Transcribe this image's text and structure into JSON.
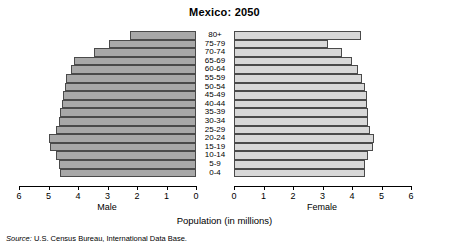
{
  "chart_data": {
    "type": "bar",
    "chart_subtype": "population-pyramid",
    "title": "Mexico: 2050",
    "xlabel": "Population (in millions)",
    "ylabel": "",
    "unit": "millions",
    "categories": [
      "80+",
      "75-79",
      "70-74",
      "65-69",
      "60-64",
      "55-59",
      "50-54",
      "45-49",
      "40-44",
      "35-39",
      "30-34",
      "25-29",
      "20-24",
      "15-19",
      "10-14",
      "5-9",
      "0-4"
    ],
    "series": [
      {
        "name": "Male",
        "side": "left",
        "axis_range": [
          0,
          6
        ],
        "axis_direction": "reverse",
        "values": [
          2.25,
          2.95,
          3.45,
          4.15,
          4.25,
          4.4,
          4.45,
          4.5,
          4.55,
          4.6,
          4.65,
          4.75,
          5.0,
          4.95,
          4.75,
          4.65,
          4.6
        ]
      },
      {
        "name": "Female",
        "side": "right",
        "axis_range": [
          0,
          6
        ],
        "axis_direction": "normal",
        "values": [
          4.3,
          3.2,
          3.65,
          4.0,
          4.2,
          4.35,
          4.45,
          4.5,
          4.5,
          4.55,
          4.55,
          4.6,
          4.75,
          4.7,
          4.55,
          4.45,
          4.45
        ]
      }
    ],
    "xticks_male": [
      "6",
      "5",
      "4",
      "3",
      "2",
      "1",
      "0"
    ],
    "xticks_female": [
      "0",
      "1",
      "2",
      "3",
      "4",
      "5",
      "6"
    ],
    "grid": false,
    "legend": "none",
    "colors": {
      "male_bar": "#a8a8a8",
      "female_bar": "#d8d8d8",
      "bar_outline": "#4a4a4a",
      "axis": "#000000",
      "background": "#ffffff"
    }
  },
  "labels": {
    "male_axis_title": "Male",
    "female_axis_title": "Female"
  },
  "source": {
    "prefix": "Source:",
    "text": " U.S. Census Bureau, International Data Base."
  }
}
